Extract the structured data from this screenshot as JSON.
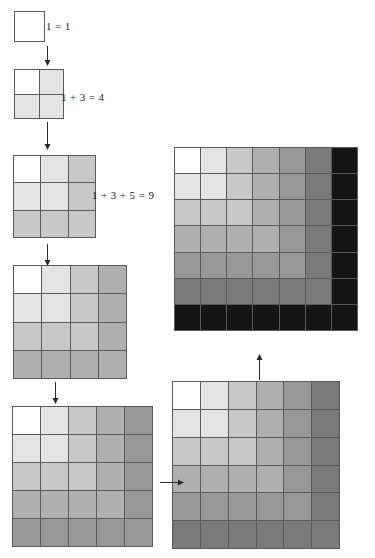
{
  "figure": {
    "background_color": "#ffffff",
    "gridline_color": "#5a5a5a",
    "arrow_color": "#2b2b2b",
    "palette": [
      "#ffffff",
      "#e3e3e3",
      "#c8c8c8",
      "#b0b0b0",
      "#989898",
      "#7a7a7a",
      "#5e5e5e",
      "#141414"
    ]
  },
  "labels": [
    {
      "id": "eq-1",
      "text": "1 = 1",
      "x": 46,
      "y": 21
    },
    {
      "id": "eq-4",
      "text": "1 + 3 = 4",
      "x": 61,
      "y": 92
    },
    {
      "id": "eq-9",
      "text": "1 + 3 + 5 = 9",
      "x": 92,
      "y": 190
    }
  ],
  "arrows": [
    {
      "id": "arrow-1-to-2",
      "direction": "down",
      "x": 44,
      "y": 46,
      "length": 20
    },
    {
      "id": "arrow-2-to-3",
      "direction": "down",
      "x": 44,
      "y": 122,
      "length": 28
    },
    {
      "id": "arrow-3-to-4",
      "direction": "down",
      "x": 44,
      "y": 244,
      "length": 22
    },
    {
      "id": "arrow-4-to-5",
      "direction": "down",
      "x": 52,
      "y": 382,
      "length": 22
    },
    {
      "id": "arrow-5-to-6",
      "direction": "right",
      "x": 160,
      "y": 479,
      "length": 24
    },
    {
      "id": "arrow-6-to-7",
      "direction": "up",
      "x": 256,
      "y": 354,
      "length": 26
    }
  ],
  "grids": [
    {
      "id": "square-1",
      "n": 1,
      "sum_label": "1 = 1",
      "x": 14,
      "y": 11,
      "size": 31,
      "shades": [
        [
          0
        ]
      ]
    },
    {
      "id": "square-2",
      "n": 2,
      "sum_label": "1 + 3 = 4",
      "x": 14,
      "y": 69,
      "size": 50,
      "shades": [
        [
          0,
          1
        ],
        [
          1,
          1
        ]
      ]
    },
    {
      "id": "square-3",
      "n": 3,
      "sum_label": "1 + 3 + 5 = 9",
      "x": 13,
      "y": 155,
      "size": 83,
      "shades": [
        [
          0,
          1,
          2
        ],
        [
          1,
          1,
          2
        ],
        [
          2,
          2,
          2
        ]
      ]
    },
    {
      "id": "square-4",
      "n": 4,
      "sum_label": "1 + 3 + 5 + 7 = 16",
      "x": 13,
      "y": 265,
      "size": 114,
      "shades": [
        [
          0,
          1,
          2,
          3
        ],
        [
          1,
          1,
          2,
          3
        ],
        [
          2,
          2,
          2,
          3
        ],
        [
          3,
          3,
          3,
          3
        ]
      ]
    },
    {
      "id": "square-5",
      "n": 5,
      "sum_label": "1 + 3 + 5 + 7 + 9 = 25",
      "x": 12,
      "y": 406,
      "size": 141,
      "shades": [
        [
          0,
          1,
          2,
          3,
          4
        ],
        [
          1,
          1,
          2,
          3,
          4
        ],
        [
          2,
          2,
          2,
          3,
          4
        ],
        [
          3,
          3,
          3,
          3,
          4
        ],
        [
          4,
          4,
          4,
          4,
          4
        ]
      ]
    },
    {
      "id": "square-6",
      "n": 6,
      "sum_label": "1 + 3 + 5 + 7 + 9 + 11 = 36",
      "x": 172,
      "y": 381,
      "size": 168,
      "shades": [
        [
          0,
          1,
          2,
          3,
          4,
          5
        ],
        [
          1,
          1,
          2,
          3,
          4,
          5
        ],
        [
          2,
          2,
          2,
          3,
          4,
          5
        ],
        [
          3,
          3,
          3,
          3,
          4,
          5
        ],
        [
          4,
          4,
          4,
          4,
          4,
          5
        ],
        [
          5,
          5,
          5,
          5,
          5,
          5
        ]
      ]
    },
    {
      "id": "square-7",
      "n": 7,
      "sum_label": "1 + 3 + 5 + 7 + 9 + 11 + 13 = 49",
      "x": 174,
      "y": 147,
      "size": 184,
      "shades": [
        [
          0,
          1,
          2,
          3,
          4,
          5,
          7
        ],
        [
          1,
          1,
          2,
          3,
          4,
          5,
          7
        ],
        [
          2,
          2,
          2,
          3,
          4,
          5,
          7
        ],
        [
          3,
          3,
          3,
          3,
          4,
          5,
          7
        ],
        [
          4,
          4,
          4,
          4,
          4,
          5,
          7
        ],
        [
          5,
          5,
          5,
          5,
          5,
          5,
          7
        ],
        [
          7,
          7,
          7,
          7,
          7,
          7,
          7
        ]
      ]
    }
  ]
}
